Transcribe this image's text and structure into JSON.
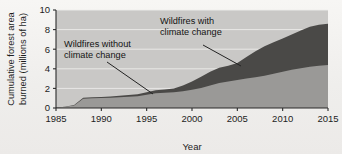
{
  "figure": {
    "background_color": "#efeeec",
    "plot_background_color": "#c9c8c6",
    "gridline_color": "#f0efed",
    "axis_color": "#2b2b2b"
  },
  "chart_data": {
    "type": "area",
    "stacked": true,
    "title": "",
    "xlabel": "Year",
    "ylabel": "Cumulative forest area burned (millions of ha)",
    "xlim": [
      1985,
      2015
    ],
    "ylim": [
      0,
      10
    ],
    "xticks": [
      1985,
      1990,
      1995,
      2000,
      2005,
      2010,
      2015
    ],
    "xticklabels": [
      "1985",
      "1990",
      "1995",
      "2000",
      "2005",
      "2010",
      "2015"
    ],
    "yticks": [
      0,
      2,
      4,
      6,
      8,
      10
    ],
    "yticklabels": [
      "0",
      "2",
      "4",
      "6",
      "8",
      "10"
    ],
    "grid": true,
    "legend_position": "annotations",
    "x": [
      1985,
      1986,
      1987,
      1988,
      1989,
      1990,
      1991,
      1992,
      1993,
      1994,
      1995,
      1996,
      1997,
      1998,
      1999,
      2000,
      2001,
      2002,
      2003,
      2004,
      2005,
      2006,
      2007,
      2008,
      2009,
      2010,
      2011,
      2012,
      2013,
      2014,
      2015
    ],
    "series": [
      {
        "name": "Wildfires without climate change",
        "color": "#9a9997",
        "values": [
          0.05,
          0.12,
          0.25,
          0.95,
          1.0,
          1.02,
          1.05,
          1.1,
          1.15,
          1.2,
          1.35,
          1.5,
          1.55,
          1.6,
          1.7,
          1.85,
          2.05,
          2.3,
          2.55,
          2.7,
          2.85,
          3.0,
          3.15,
          3.3,
          3.5,
          3.7,
          3.9,
          4.05,
          4.2,
          4.3,
          4.4
        ]
      },
      {
        "name": "Wildfires with climate change",
        "color": "#4a4947",
        "values": [
          0.06,
          0.14,
          0.3,
          1.05,
          1.1,
          1.13,
          1.18,
          1.25,
          1.32,
          1.4,
          1.6,
          1.8,
          1.9,
          2.0,
          2.3,
          2.7,
          3.2,
          3.7,
          4.1,
          4.3,
          4.6,
          5.2,
          5.8,
          6.3,
          6.7,
          7.1,
          7.5,
          7.9,
          8.3,
          8.5,
          8.6
        ]
      }
    ],
    "annotations": [
      {
        "label_line_1": "Wildfires without",
        "label_line_2": "climate change",
        "points_to": "lower band near 1995"
      },
      {
        "label_line_1": "Wildfires with",
        "label_line_2": "climate change",
        "points_to": "upper dark band near 2005"
      }
    ]
  }
}
